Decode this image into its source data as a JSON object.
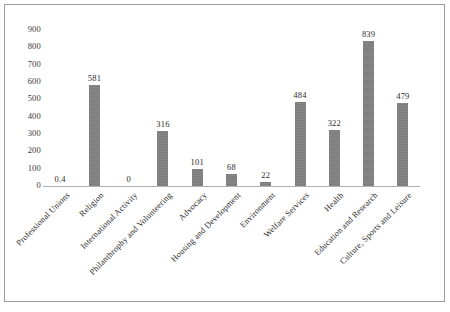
{
  "chart_data": {
    "type": "bar",
    "title": "",
    "subtitle": "",
    "xlabel": "",
    "ylabel": "",
    "ylim": [
      0,
      900
    ],
    "ytick_step": 100,
    "yticks": [
      "900",
      "800",
      "700",
      "600",
      "500",
      "400",
      "300",
      "200",
      "100",
      "0"
    ],
    "grid": false,
    "legend": false,
    "bar_color": "#808080",
    "categories": [
      "Professional Unions",
      "Religion",
      "International Activity",
      "Philanthrophy and Volunteering",
      "Advocacy",
      "Housing and Development",
      "Environment",
      "Welfare Services",
      "Health",
      "Education and Research",
      "Culture, Sports and Leisure"
    ],
    "values": [
      0.4,
      581,
      0,
      316,
      101,
      68,
      22,
      484,
      322,
      839,
      479
    ],
    "value_labels": [
      "0.4",
      "581",
      "0",
      "316",
      "101",
      "68",
      "22",
      "484",
      "322",
      "839",
      "479"
    ]
  }
}
